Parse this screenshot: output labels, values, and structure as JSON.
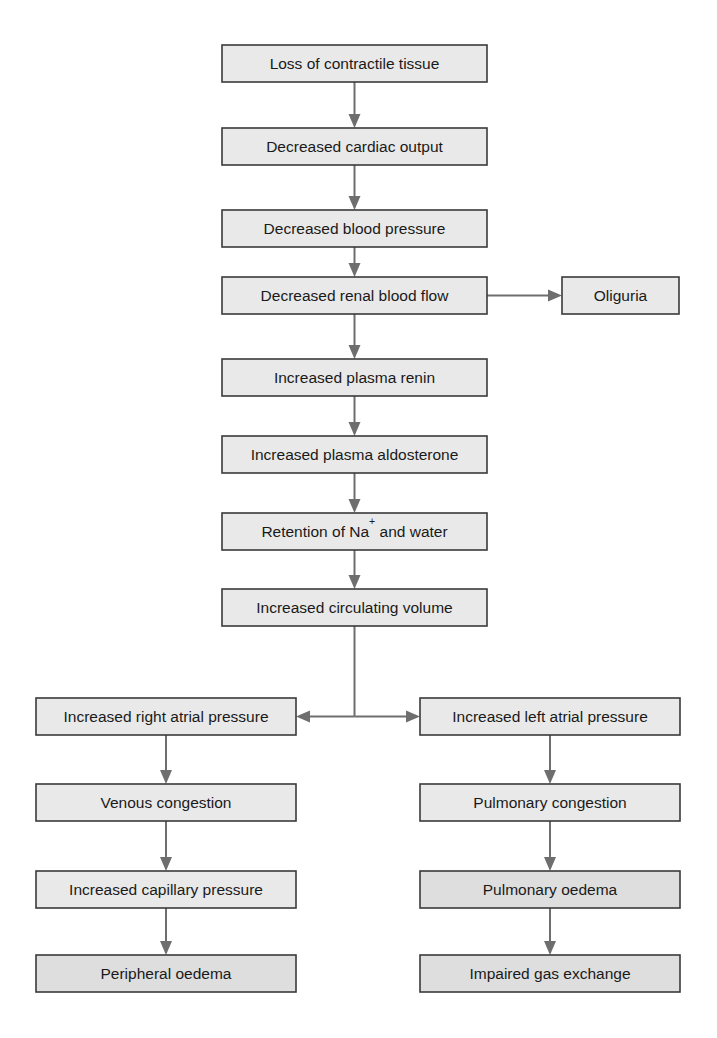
{
  "diagram": {
    "colors": {
      "box_fill": "#e9e9e9",
      "box_fill_shaded": "#dedede",
      "box_stroke": "#3a3a3a",
      "connector": "#6e6e6e",
      "text": "#1a1a1a",
      "background": "#ffffff"
    },
    "nodes": [
      {
        "id": "loss-of-contractile-tissue",
        "label": "Loss of contractile tissue",
        "x": 222,
        "y": 45,
        "w": 265,
        "h": 37,
        "shaded": false
      },
      {
        "id": "decreased-cardiac-output",
        "label": "Decreased cardiac output",
        "x": 222,
        "y": 128,
        "w": 265,
        "h": 37,
        "shaded": false
      },
      {
        "id": "decreased-blood-pressure",
        "label": "Decreased blood pressure",
        "x": 222,
        "y": 210,
        "w": 265,
        "h": 37,
        "shaded": false
      },
      {
        "id": "decreased-renal-blood-flow",
        "label": "Decreased renal blood flow",
        "x": 222,
        "y": 277,
        "w": 265,
        "h": 37,
        "shaded": false
      },
      {
        "id": "oliguria",
        "label": "Oliguria",
        "x": 562,
        "y": 277,
        "w": 117,
        "h": 37,
        "shaded": false
      },
      {
        "id": "increased-plasma-renin",
        "label": "Increased plasma renin",
        "x": 222,
        "y": 359,
        "w": 265,
        "h": 37,
        "shaded": false
      },
      {
        "id": "increased-plasma-aldosterone",
        "label": "Increased plasma aldosterone",
        "x": 222,
        "y": 436,
        "w": 265,
        "h": 37,
        "shaded": false
      },
      {
        "id": "retention-of-sodium-and-water",
        "label": "Retention of Na",
        "label_sup": "+",
        "label_tail": " and water",
        "x": 222,
        "y": 513,
        "w": 265,
        "h": 37,
        "shaded": false
      },
      {
        "id": "increased-circulating-volume",
        "label": "Increased circulating volume",
        "x": 222,
        "y": 589,
        "w": 265,
        "h": 37,
        "shaded": false
      },
      {
        "id": "increased-right-atrial-pressure",
        "label": "Increased right atrial pressure",
        "x": 36,
        "y": 698,
        "w": 260,
        "h": 37,
        "shaded": false
      },
      {
        "id": "increased-left-atrial-pressure",
        "label": "Increased left atrial pressure",
        "x": 420,
        "y": 698,
        "w": 260,
        "h": 37,
        "shaded": false
      },
      {
        "id": "venous-congestion",
        "label": "Venous congestion",
        "x": 36,
        "y": 784,
        "w": 260,
        "h": 37,
        "shaded": false
      },
      {
        "id": "pulmonary-congestion",
        "label": "Pulmonary congestion",
        "x": 420,
        "y": 784,
        "w": 260,
        "h": 37,
        "shaded": false
      },
      {
        "id": "increased-capillary-pressure",
        "label": "Increased capillary pressure",
        "x": 36,
        "y": 871,
        "w": 260,
        "h": 37,
        "shaded": false
      },
      {
        "id": "pulmonary-oedema",
        "label": "Pulmonary oedema",
        "x": 420,
        "y": 871,
        "w": 260,
        "h": 37,
        "shaded": true
      },
      {
        "id": "peripheral-oedema",
        "label": "Peripheral oedema",
        "x": 36,
        "y": 955,
        "w": 260,
        "h": 37,
        "shaded": true
      },
      {
        "id": "impaired-gas-exchange",
        "label": "Impaired gas exchange",
        "x": 420,
        "y": 955,
        "w": 260,
        "h": 37,
        "shaded": true
      }
    ],
    "connectors": [
      {
        "id": "arrow-loss-to-cardiac-output",
        "from": "loss-of-contractile-tissue",
        "to": "decreased-cardiac-output",
        "kind": "vertical-down"
      },
      {
        "id": "arrow-cardiac-output-to-blood-pressure",
        "from": "decreased-cardiac-output",
        "to": "decreased-blood-pressure",
        "kind": "vertical-down"
      },
      {
        "id": "arrow-blood-pressure-to-renal-flow",
        "from": "decreased-blood-pressure",
        "to": "decreased-renal-blood-flow",
        "kind": "vertical-down"
      },
      {
        "id": "arrow-renal-flow-to-oliguria",
        "from": "decreased-renal-blood-flow",
        "to": "oliguria",
        "kind": "horizontal-right"
      },
      {
        "id": "arrow-renal-flow-to-plasma-renin",
        "from": "decreased-renal-blood-flow",
        "to": "increased-plasma-renin",
        "kind": "vertical-down"
      },
      {
        "id": "arrow-renin-to-aldosterone",
        "from": "increased-plasma-renin",
        "to": "increased-plasma-aldosterone",
        "kind": "vertical-down"
      },
      {
        "id": "arrow-aldosterone-to-retention",
        "from": "increased-plasma-aldosterone",
        "to": "retention-of-sodium-and-water",
        "kind": "vertical-down"
      },
      {
        "id": "arrow-retention-to-circulating-volume",
        "from": "retention-of-sodium-and-water",
        "to": "increased-circulating-volume",
        "kind": "vertical-down"
      },
      {
        "id": "branch-circulating-volume-to-atria",
        "from": "increased-circulating-volume",
        "to": "increased-right-atrial-pressure,increased-left-atrial-pressure",
        "kind": "t-split-both-arrows"
      },
      {
        "id": "arrow-right-atrial-to-venous-congestion",
        "from": "increased-right-atrial-pressure",
        "to": "venous-congestion",
        "kind": "vertical-down"
      },
      {
        "id": "arrow-venous-congestion-to-capillary-pressure",
        "from": "venous-congestion",
        "to": "increased-capillary-pressure",
        "kind": "vertical-down"
      },
      {
        "id": "arrow-capillary-pressure-to-peripheral-oedema",
        "from": "increased-capillary-pressure",
        "to": "peripheral-oedema",
        "kind": "vertical-down"
      },
      {
        "id": "arrow-left-atrial-to-pulmonary-congestion",
        "from": "increased-left-atrial-pressure",
        "to": "pulmonary-congestion",
        "kind": "vertical-down"
      },
      {
        "id": "arrow-pulmonary-congestion-to-pulmonary-oedema",
        "from": "pulmonary-congestion",
        "to": "pulmonary-oedema",
        "kind": "vertical-down"
      },
      {
        "id": "arrow-pulmonary-oedema-to-impaired-gas-exchange",
        "from": "pulmonary-oedema",
        "to": "impaired-gas-exchange",
        "kind": "vertical-down"
      }
    ]
  }
}
